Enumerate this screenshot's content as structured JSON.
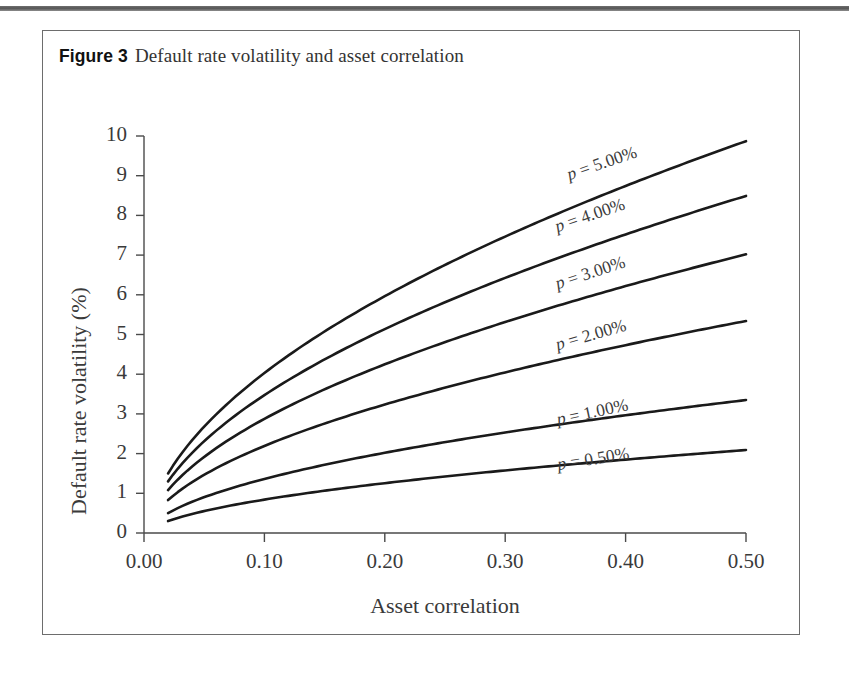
{
  "figure": {
    "label": "Figure 3",
    "title": "Default rate volatility and asset correlation"
  },
  "chart_data": {
    "type": "line",
    "title": "Default rate volatility and asset correlation",
    "xlabel": "Asset correlation",
    "ylabel": "Default rate volatility (%)",
    "xlim": [
      0.0,
      0.5
    ],
    "ylim": [
      0,
      10
    ],
    "xticks": [
      "0.00",
      "0.10",
      "0.20",
      "0.30",
      "0.40",
      "0.50"
    ],
    "xtick_values": [
      0.0,
      0.1,
      0.2,
      0.3,
      0.4,
      0.5
    ],
    "yticks": [
      "0",
      "1",
      "2",
      "3",
      "4",
      "5",
      "6",
      "7",
      "8",
      "9",
      "10"
    ],
    "ytick_values": [
      0,
      1,
      2,
      3,
      4,
      5,
      6,
      7,
      8,
      9,
      10
    ],
    "grid": false,
    "legend_position": "inline-curve-labels",
    "x": [
      0.02,
      0.05,
      0.08,
      0.1,
      0.13,
      0.15,
      0.18,
      0.2,
      0.23,
      0.25,
      0.28,
      0.3,
      0.33,
      0.35,
      0.38,
      0.4,
      0.43,
      0.45,
      0.48,
      0.5
    ],
    "series": [
      {
        "name": "p = 5.00%",
        "label": "p = 5.00%",
        "p": 5.0,
        "values": [
          1.5,
          2.45,
          3.1,
          3.48,
          4.0,
          4.32,
          4.76,
          5.04,
          5.44,
          5.69,
          6.05,
          6.28,
          6.61,
          6.82,
          7.13,
          7.33,
          7.62,
          7.81,
          8.08,
          8.26
        ],
        "values_scaled_note": "curve drawn to endpoint 9.87 at x=0.50"
      },
      {
        "name": "p = 4.00%",
        "label": "p = 4.00%",
        "p": 4.0,
        "values": [
          1.3,
          2.12,
          2.68,
          3.0,
          3.45,
          3.73,
          4.1,
          4.34,
          4.68,
          4.9,
          5.21,
          5.4,
          5.68,
          5.86,
          6.13,
          6.29,
          6.54,
          6.7,
          6.93,
          7.08
        ],
        "values_scaled_note": "curve drawn to endpoint 8.49 at x=0.50"
      },
      {
        "name": "p = 3.00%",
        "label": "p = 3.00%",
        "p": 3.0,
        "values": [
          1.08,
          1.75,
          2.21,
          2.47,
          2.84,
          3.07,
          3.37,
          3.56,
          3.84,
          4.02,
          4.27,
          4.43,
          4.66,
          4.8,
          5.02,
          5.16,
          5.36,
          5.49,
          5.68,
          5.8
        ],
        "values_scaled_note": "curve drawn to endpoint 7.02 at x=0.50"
      },
      {
        "name": "p = 2.00%",
        "label": "p = 2.00%",
        "p": 2.0,
        "values": [
          0.83,
          1.34,
          1.69,
          1.89,
          2.17,
          2.34,
          2.57,
          2.72,
          2.93,
          3.06,
          3.25,
          3.37,
          3.54,
          3.65,
          3.81,
          3.92,
          4.07,
          4.17,
          4.31,
          4.4
        ],
        "values_scaled_note": "curve drawn to endpoint 5.34 at x=0.50"
      },
      {
        "name": "p = 1.00%",
        "label": "p = 1.00%",
        "p": 1.0,
        "values": [
          0.5,
          0.81,
          1.02,
          1.14,
          1.31,
          1.41,
          1.55,
          1.64,
          1.77,
          1.85,
          1.96,
          2.04,
          2.14,
          2.21,
          2.31,
          2.37,
          2.46,
          2.52,
          2.61,
          2.66
        ],
        "values_scaled_note": "curve drawn to endpoint 3.35 at x=0.50"
      },
      {
        "name": "p = 0.50%",
        "label": "p = 0.50%",
        "p": 0.5,
        "values": [
          0.3,
          0.49,
          0.62,
          0.69,
          0.79,
          0.86,
          0.94,
          1.0,
          1.07,
          1.12,
          1.19,
          1.24,
          1.3,
          1.34,
          1.4,
          1.44,
          1.5,
          1.53,
          1.58,
          1.62
        ],
        "values_scaled_note": "curve drawn to endpoint 2.09 at x=0.50"
      }
    ],
    "endpoints_at_x_max": [
      9.87,
      8.49,
      7.02,
      5.34,
      3.35,
      2.09
    ],
    "startpoints_at_x_min": [
      1.5,
      1.3,
      1.08,
      0.83,
      0.5,
      0.3
    ],
    "colors": {
      "curve": "#1a1a1a",
      "axis": "#4a4a4a",
      "text": "#3a3a3a",
      "frame": "#6d6d6d",
      "background": "#ffffff"
    }
  },
  "curve_labels": [
    {
      "text": "p = 5.00%",
      "x": 0.355,
      "y": 9.3,
      "angle": -19
    },
    {
      "text": "p = 4.00%",
      "x": 0.345,
      "y": 7.98,
      "angle": -19
    },
    {
      "text": "p = 3.00%",
      "x": 0.345,
      "y": 6.55,
      "angle": -18
    },
    {
      "text": "p = 2.00%",
      "x": 0.345,
      "y": 5.02,
      "angle": -16
    },
    {
      "text": "p = 1.00%",
      "x": 0.345,
      "y": 3.12,
      "angle": -12
    },
    {
      "text": "p = 0.50%",
      "x": 0.345,
      "y": 1.98,
      "angle": -9
    }
  ]
}
